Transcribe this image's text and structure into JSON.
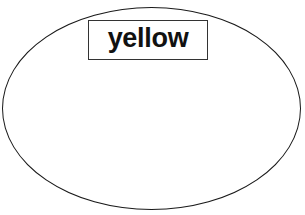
{
  "diagram": {
    "shape": "ellipse",
    "label": "yellow",
    "colors": {
      "stroke": "#1a1a1a",
      "fill": "#ffffff",
      "text": "#111111"
    }
  }
}
